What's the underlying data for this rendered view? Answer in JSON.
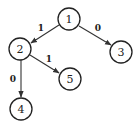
{
  "diagram": {
    "type": "tree",
    "nodes": [
      {
        "id": "1",
        "label": "1",
        "x": 69,
        "y": 19
      },
      {
        "id": "2",
        "label": "2",
        "x": 20,
        "y": 49
      },
      {
        "id": "3",
        "label": "3",
        "x": 121,
        "y": 52
      },
      {
        "id": "4",
        "label": "4",
        "x": 21,
        "y": 109
      },
      {
        "id": "5",
        "label": "5",
        "x": 70,
        "y": 79
      }
    ],
    "edges": [
      {
        "from": "1",
        "to": "2",
        "label": "1"
      },
      {
        "from": "1",
        "to": "3",
        "label": "0"
      },
      {
        "from": "2",
        "to": "4",
        "label": "0"
      },
      {
        "from": "2",
        "to": "5",
        "label": "1"
      }
    ]
  }
}
